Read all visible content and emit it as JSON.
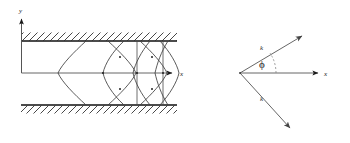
{
  "figure": {
    "title": "",
    "background_color": "#ffffff",
    "line_color": "#3a3a3a",
    "wall_color": "#111111",
    "panels": [
      {
        "id": "left-panel",
        "name": "waveguide-channel-diagram",
        "description": "Parallel-plate channel with hatched walls and crossing wave-front curves",
        "axes": {
          "x_label": "x",
          "y_label": "y"
        },
        "walls": {
          "top_label": "top-wall",
          "bottom_label": "bottom-wall",
          "hatch_style": "diagonal"
        }
      },
      {
        "id": "right-panel",
        "name": "wavevector-diagram",
        "description": "Two wavevector rays symmetric about the x axis with angle phi",
        "axes": {
          "x_label": "x"
        },
        "vectors": [
          {
            "label": "k",
            "direction": "upper-right"
          },
          {
            "label": "k",
            "direction": "lower-right"
          }
        ],
        "angle": {
          "label": "ϕ",
          "symbol_name": "phi"
        }
      }
    ]
  }
}
